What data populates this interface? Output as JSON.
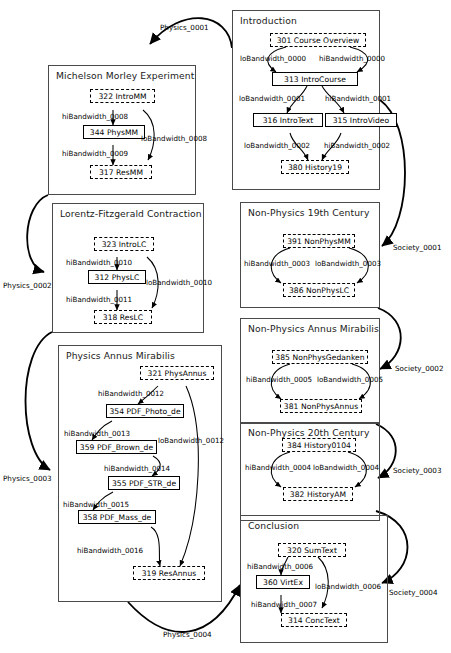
{
  "diagram": {
    "type": "flow-diagram",
    "width": 451,
    "height": 653,
    "colors": {
      "background": "#ffffff",
      "group_border": "#4a4a4a",
      "node_border": "#000000",
      "edge": "#000000",
      "text": "#000000"
    }
  },
  "groups": [
    {
      "id": "introduction",
      "label": "Introduction"
    },
    {
      "id": "michelson_morley",
      "label": "Michelson Morley Experiment"
    },
    {
      "id": "lorentz_fitzgerald",
      "label": "Lorentz-Fitzgerald Contraction"
    },
    {
      "id": "physics_annus",
      "label": "Physics Annus Mirabilis"
    },
    {
      "id": "nonphys_19th",
      "label": "Non-Physics 19th Century"
    },
    {
      "id": "nonphys_annus",
      "label": "Non-Physics Annus Mirabilis"
    },
    {
      "id": "nonphys_20th",
      "label": "Non-Physics 20th Century"
    },
    {
      "id": "conclusion",
      "label": "Conclusion"
    }
  ],
  "nodes": [
    {
      "id": "n301",
      "label": "301 Course Overview",
      "style": "dashed",
      "group": "introduction"
    },
    {
      "id": "n313",
      "label": "313 IntroCourse",
      "style": "solid",
      "group": "introduction"
    },
    {
      "id": "n316",
      "label": "316 IntroText",
      "style": "solid",
      "group": "introduction"
    },
    {
      "id": "n315",
      "label": "315 IntroVideo",
      "style": "solid",
      "group": "introduction"
    },
    {
      "id": "n380",
      "label": "380 History19",
      "style": "dashed",
      "group": "introduction"
    },
    {
      "id": "n322",
      "label": "322 IntroMM",
      "style": "dashed",
      "group": "michelson_morley"
    },
    {
      "id": "n344",
      "label": "344 PhysMM",
      "style": "solid",
      "group": "michelson_morley"
    },
    {
      "id": "n317",
      "label": "317 ResMM",
      "style": "dashed",
      "group": "michelson_morley"
    },
    {
      "id": "n323",
      "label": "323 IntroLC",
      "style": "dashed",
      "group": "lorentz_fitzgerald"
    },
    {
      "id": "n312",
      "label": "312 PhysLC",
      "style": "solid",
      "group": "lorentz_fitzgerald"
    },
    {
      "id": "n318",
      "label": "318 ResLC",
      "style": "dashed",
      "group": "lorentz_fitzgerald"
    },
    {
      "id": "n321",
      "label": "321 PhysAnnus",
      "style": "dashed",
      "group": "physics_annus"
    },
    {
      "id": "n354",
      "label": "354 PDF_Photo_de",
      "style": "solid",
      "group": "physics_annus"
    },
    {
      "id": "n359",
      "label": "359 PDF_Brown_de",
      "style": "solid",
      "group": "physics_annus"
    },
    {
      "id": "n355",
      "label": "355 PDF_STR_de",
      "style": "solid",
      "group": "physics_annus"
    },
    {
      "id": "n358",
      "label": "358 PDF_Mass_de",
      "style": "solid",
      "group": "physics_annus"
    },
    {
      "id": "n319",
      "label": "319 ResAnnus",
      "style": "dashed",
      "group": "physics_annus"
    },
    {
      "id": "n391",
      "label": "391 NonPhysMM",
      "style": "dashed",
      "group": "nonphys_19th"
    },
    {
      "id": "n386",
      "label": "386 NonPhysLC",
      "style": "dashed",
      "group": "nonphys_19th"
    },
    {
      "id": "n385",
      "label": "385 NonPhysGedanken",
      "style": "dashed",
      "group": "nonphys_annus"
    },
    {
      "id": "n381",
      "label": "381 NonPhysAnnus",
      "style": "dashed",
      "group": "nonphys_annus"
    },
    {
      "id": "n384",
      "label": "384 History0104",
      "style": "dashed",
      "group": "nonphys_20th"
    },
    {
      "id": "n382",
      "label": "382 HistoryAM",
      "style": "dashed",
      "group": "nonphys_20th"
    },
    {
      "id": "n320",
      "label": "320 SumText",
      "style": "dashed",
      "group": "conclusion"
    },
    {
      "id": "n360",
      "label": "360 VirtEx",
      "style": "solid",
      "group": "conclusion"
    },
    {
      "id": "n314",
      "label": "314 ConcText",
      "style": "dashed",
      "group": "conclusion"
    }
  ],
  "edge_labels": {
    "lo0000": "loBandwidth_0000",
    "hi0000": "hiBandwidth_0000",
    "lo0001": "loBandwidth_0001",
    "hi0001": "hiBandwidth_0001",
    "lo0002": "loBandwidth_0002",
    "hi0002": "hiBandwidth_0002",
    "hi0008": "hiBandwidth_0008",
    "lo0008": "loBandwidth_0008",
    "hi0009": "hiBandwidth_0009",
    "hi0010": "hiBandwidth_0010",
    "lo0010": "loBandwidth_0010",
    "hi0011": "hiBandwidth_0011",
    "hi0012": "hiBandwidth_0012",
    "lo0012": "loBandwidth_0012",
    "hi0013": "hiBandwidth_0013",
    "hi0014": "hiBandwidth_0014",
    "hi0015": "hiBandwidth_0015",
    "hi0016": "hiBandwidth_0016",
    "hi0003": "hiBandwidth_0003",
    "lo0003": "loBandwidth_0003",
    "hi0005": "hiBandwidth_0005",
    "lo0005": "loBandwidth_0005",
    "hi0004": "hiBandwidth_0004",
    "lo0004": "loBandwidth_0004",
    "hi0006": "hiBandwidth_0006",
    "lo0006": "loBandwidth_0006",
    "hi0007": "hiBandwidth_0007",
    "physics0001": "Physics_0001",
    "physics0002": "Physics_0002",
    "physics0003": "Physics_0003",
    "physics0004": "Physics_0004",
    "society0001": "Society_0001",
    "society0002": "Society_0002",
    "society0003": "Society_0003",
    "society0004": "Society_0004"
  }
}
